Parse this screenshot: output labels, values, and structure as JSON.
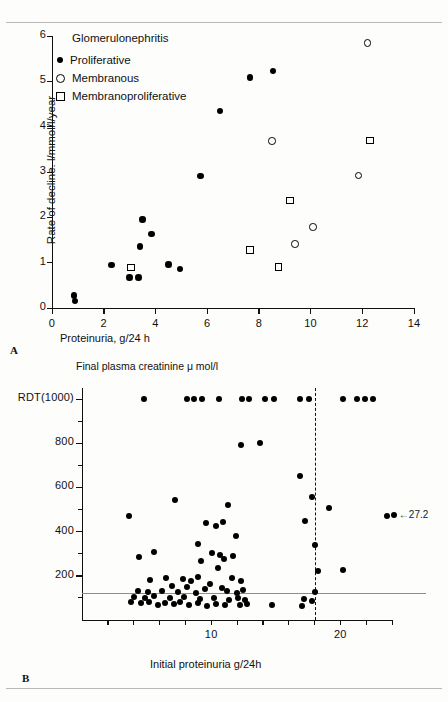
{
  "figure": {
    "panelA_letter": "A",
    "panelB_letter": "B"
  },
  "panelA": {
    "legend_title": "Glomerulonephritis",
    "legend": [
      {
        "marker": "filled-circle-icon",
        "label": "Proliferative"
      },
      {
        "marker": "open-circle-icon",
        "label": "Membranous"
      },
      {
        "marker": "open-square-icon",
        "label": "Membranoproliferative"
      }
    ],
    "ylabel": "Rate of decline. l/mmol/l/year",
    "xlabel": "Proteinuria, g/24 h",
    "yticks": [
      "0",
      "1",
      "2",
      "3",
      "4",
      "5",
      "6"
    ],
    "xticks": [
      "0",
      "2",
      "4",
      "6",
      "8",
      "10",
      "12",
      "14"
    ]
  },
  "panelB": {
    "title": "Final plasma creatinine μ mol/l",
    "xlabel": "Initial proteinuria g/24h",
    "yticks": [
      "200",
      "400",
      "600",
      "800",
      "RDT(1000)"
    ],
    "xticks": [
      "10",
      "20"
    ],
    "annotation": "←27.2"
  },
  "chart_data": [
    {
      "type": "scatter",
      "title": "Glomerulonephritis",
      "xlabel": "Proteinuria, g/24 h",
      "ylabel": "Rate of decline. l/mmol/l/year",
      "xlim": [
        0,
        14
      ],
      "ylim": [
        0,
        6
      ],
      "xticks": [
        0,
        2,
        4,
        6,
        8,
        10,
        12,
        14
      ],
      "yticks": [
        0,
        1,
        2,
        3,
        4,
        5,
        6
      ],
      "grid": false,
      "legend_position": "top-left",
      "series": [
        {
          "name": "Proliferative",
          "marker": "filled-circle",
          "points": [
            [
              0.85,
              0.28
            ],
            [
              0.88,
              0.15
            ],
            [
              2.3,
              0.95
            ],
            [
              3.0,
              0.67
            ],
            [
              3.35,
              0.67
            ],
            [
              3.4,
              1.36
            ],
            [
              3.5,
              1.95
            ],
            [
              3.85,
              1.63
            ],
            [
              4.5,
              0.96
            ],
            [
              4.95,
              0.86
            ],
            [
              5.75,
              2.91
            ],
            [
              6.5,
              4.35
            ],
            [
              7.65,
              5.09
            ],
            [
              8.55,
              5.23
            ]
          ]
        },
        {
          "name": "Membranous",
          "marker": "open-circle",
          "points": [
            [
              8.5,
              3.68
            ],
            [
              9.4,
              1.41
            ],
            [
              10.1,
              1.79
            ],
            [
              11.85,
              2.92
            ],
            [
              12.2,
              5.85
            ]
          ]
        },
        {
          "name": "Membranoproliferative",
          "marker": "open-square",
          "points": [
            [
              3.05,
              0.89
            ],
            [
              7.65,
              1.28
            ],
            [
              8.75,
              0.9
            ],
            [
              9.2,
              2.37
            ],
            [
              12.3,
              3.69
            ]
          ]
        }
      ]
    },
    {
      "type": "scatter",
      "title": "Final plasma creatinine μ mol/l",
      "xlabel": "Initial proteinuria g/24h",
      "ylabel": "",
      "xlim": [
        0,
        24
      ],
      "ylim": [
        0,
        1050
      ],
      "xticks": [
        10,
        20
      ],
      "yticks": [
        200,
        400,
        600,
        800,
        1000
      ],
      "ytick_labels": [
        "200",
        "400",
        "600",
        "800",
        "RDT(1000)"
      ],
      "grid": false,
      "reference_lines": [
        {
          "orientation": "vertical",
          "value": 18,
          "style": "dashed"
        },
        {
          "orientation": "horizontal",
          "value": 120,
          "style": "solid-grey"
        }
      ],
      "annotations": [
        {
          "text": "←27.2",
          "x": 23.6,
          "y": 470
        }
      ],
      "series": [
        {
          "name": "Patients",
          "marker": "filled-circle",
          "points": [
            [
              4.8,
              1000
            ],
            [
              8.1,
              1000
            ],
            [
              8.7,
              1000
            ],
            [
              9.3,
              1000
            ],
            [
              10.6,
              1000
            ],
            [
              12.4,
              1000
            ],
            [
              12.9,
              1000
            ],
            [
              14.2,
              1000
            ],
            [
              14.9,
              1000
            ],
            [
              16.9,
              1000
            ],
            [
              17.6,
              1000
            ],
            [
              20.2,
              1000
            ],
            [
              21.3,
              1000
            ],
            [
              21.9,
              1000
            ],
            [
              22.5,
              1000
            ],
            [
              12.3,
              790
            ],
            [
              13.8,
              800
            ],
            [
              16.9,
              650
            ],
            [
              17.8,
              555
            ],
            [
              19.1,
              505
            ],
            [
              7.2,
              545
            ],
            [
              11.3,
              520
            ],
            [
              3.6,
              470
            ],
            [
              17.3,
              450
            ],
            [
              23.6,
              470
            ],
            [
              9.6,
              440
            ],
            [
              10.4,
              425
            ],
            [
              10.9,
              445
            ],
            [
              11.9,
              380
            ],
            [
              9.0,
              345
            ],
            [
              18.0,
              340
            ],
            [
              5.6,
              310
            ],
            [
              10.1,
              305
            ],
            [
              10.7,
              295
            ],
            [
              4.4,
              285
            ],
            [
              9.2,
              265
            ],
            [
              11.0,
              275
            ],
            [
              11.7,
              290
            ],
            [
              10.5,
              235
            ],
            [
              18.3,
              220
            ],
            [
              20.2,
              225
            ],
            [
              6.5,
              190
            ],
            [
              7.8,
              185
            ],
            [
              9.0,
              195
            ],
            [
              11.6,
              190
            ],
            [
              5.3,
              180
            ],
            [
              8.4,
              175
            ],
            [
              9.9,
              165
            ],
            [
              12.3,
              175
            ],
            [
              7.0,
              155
            ],
            [
              8.1,
              150
            ],
            [
              9.5,
              140
            ],
            [
              10.8,
              145
            ],
            [
              4.3,
              130
            ],
            [
              5.1,
              125
            ],
            [
              6.2,
              130
            ],
            [
              7.4,
              125
            ],
            [
              8.8,
              120
            ],
            [
              11.2,
              130
            ],
            [
              12.0,
              120
            ],
            [
              12.5,
              135
            ],
            [
              18.0,
              125
            ],
            [
              4.0,
              105
            ],
            [
              4.9,
              100
            ],
            [
              5.6,
              108
            ],
            [
              6.8,
              98
            ],
            [
              7.9,
              105
            ],
            [
              9.1,
              95
            ],
            [
              10.2,
              100
            ],
            [
              11.4,
              92
            ],
            [
              12.1,
              100
            ],
            [
              12.6,
              90
            ],
            [
              17.2,
              95
            ],
            [
              17.8,
              88
            ],
            [
              3.8,
              80
            ],
            [
              4.6,
              75
            ],
            [
              5.2,
              82
            ],
            [
              5.9,
              70
            ],
            [
              6.4,
              78
            ],
            [
              7.1,
              72
            ],
            [
              7.6,
              80
            ],
            [
              8.3,
              68
            ],
            [
              9.0,
              75
            ],
            [
              9.7,
              65
            ],
            [
              10.4,
              72
            ],
            [
              11.1,
              70
            ],
            [
              12.2,
              68
            ],
            [
              12.8,
              72
            ],
            [
              14.7,
              70
            ],
            [
              17.0,
              65
            ]
          ]
        }
      ]
    }
  ]
}
